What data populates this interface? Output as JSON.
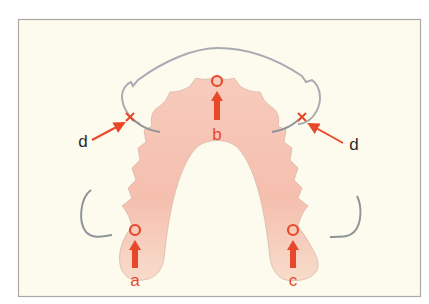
{
  "figure": {
    "colors": {
      "background": "#fdfbee",
      "frame": "#a9a9a5",
      "denture_base": "#f6c2b3",
      "denture_base_light": "#f8dccb",
      "outline_gray": "#a8acb2",
      "marker_red": "#e8482a",
      "label_dark": "#2b2b2b"
    },
    "labels": {
      "a": "a",
      "b": "b",
      "c": "c",
      "d_left": "d",
      "d_right": "d"
    },
    "markers": [
      {
        "id": "a",
        "type": "load-point",
        "symbol": "circle-with-upward-arrow"
      },
      {
        "id": "b",
        "type": "load-point",
        "symbol": "circle-with-upward-arrow"
      },
      {
        "id": "c",
        "type": "load-point",
        "symbol": "circle-with-upward-arrow"
      },
      {
        "id": "d",
        "type": "fulcrum",
        "symbol": "cross-with-pointer-arrow",
        "count": 2
      }
    ]
  }
}
